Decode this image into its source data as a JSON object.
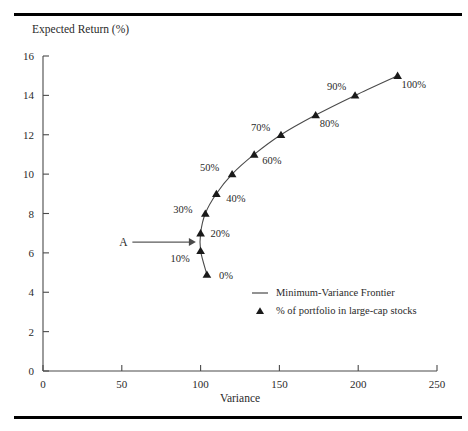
{
  "figure": {
    "has_top_rule": true,
    "has_bottom_rule": true,
    "background_color": "#ffffff",
    "line_color": "#4a4a4a",
    "marker_color": "#1a1a1a"
  },
  "chart_data": {
    "type": "line",
    "title": "",
    "subtitle": "",
    "xlabel": "Variance",
    "ylabel": "Expected Return (%)",
    "xlim": [
      0,
      250
    ],
    "ylim": [
      0,
      16
    ],
    "xticks": [
      0,
      50,
      100,
      150,
      200,
      250
    ],
    "yticks": [
      0,
      2,
      4,
      6,
      8,
      10,
      12,
      14,
      16
    ],
    "xtick_labels": [
      "0",
      "50",
      "100",
      "150",
      "200",
      "250"
    ],
    "ytick_labels": [
      "0",
      "2",
      "4",
      "6",
      "8",
      "10",
      "12",
      "14",
      "16"
    ],
    "grid": false,
    "legend_position": "inside-lower-right",
    "series": [
      {
        "name": "Minimum-Variance Frontier",
        "marker": "triangle",
        "points": [
          {
            "label": "0%",
            "x": 104,
            "y": 4.9,
            "label_dx": 12,
            "label_dy": 4
          },
          {
            "label": "10%",
            "x": 100,
            "y": 6.1,
            "label_dx": -30,
            "label_dy": 11
          },
          {
            "label": "20%",
            "x": 100,
            "y": 7.0,
            "label_dx": 10,
            "label_dy": 4
          },
          {
            "label": "30%",
            "x": 103,
            "y": 8.0,
            "label_dx": -32,
            "label_dy": -1
          },
          {
            "label": "40%",
            "x": 110,
            "y": 9.0,
            "label_dx": 10,
            "label_dy": 8
          },
          {
            "label": "50%",
            "x": 120,
            "y": 10.0,
            "label_dx": -32,
            "label_dy": -3
          },
          {
            "label": "60%",
            "x": 134,
            "y": 11.0,
            "label_dx": 8,
            "label_dy": 10
          },
          {
            "label": "70%",
            "x": 151,
            "y": 12.0,
            "label_dx": -30,
            "label_dy": -4
          },
          {
            "label": "80%",
            "x": 173,
            "y": 13.0,
            "label_dx": 4,
            "label_dy": 12
          },
          {
            "label": "90%",
            "x": 198,
            "y": 14.0,
            "label_dx": -28,
            "label_dy": -5
          },
          {
            "label": "100%",
            "x": 225,
            "y": 15.0,
            "label_dx": 4,
            "label_dy": 12
          }
        ]
      }
    ],
    "annotations": [
      {
        "text": "A",
        "x": 51,
        "y": 6.55,
        "arrow_to_x": 97,
        "arrow_to_y": 6.55
      }
    ],
    "legend": [
      {
        "marker": "line",
        "label": "Minimum-Variance Frontier"
      },
      {
        "marker": "triangle",
        "label": "% of portfolio in large-cap stocks"
      }
    ]
  }
}
